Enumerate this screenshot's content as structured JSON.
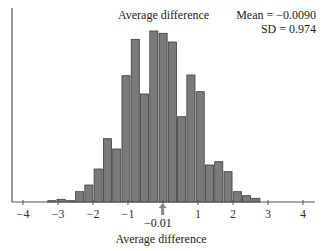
{
  "chart_data": {
    "type": "bar",
    "title": "Average difference",
    "xlabel": "Average difference",
    "ylabel": "",
    "annotations": {
      "mean_text": "Mean = −0.0090",
      "sd_text": "SD = 0.974",
      "mean_marker_label": "−0.01",
      "mean_marker_value": -0.01
    },
    "xlim": [
      -4.2,
      4.4
    ],
    "xticks": [
      -4,
      -3,
      -2,
      -1,
      0,
      1,
      2,
      3,
      4
    ],
    "xtick_labels": [
      "−4",
      "−3",
      "−2",
      "−1",
      "",
      "1",
      "2",
      "3",
      "4"
    ],
    "bin_start": -3.31,
    "bin_width": 0.265,
    "values": [
      1.3,
      2.7,
      1.3,
      10.3,
      17,
      33,
      63.3,
      53,
      126.3,
      162.7,
      108,
      171,
      168.7,
      160,
      85.3,
      127,
      110.3,
      37,
      40.3,
      30.3,
      10.3,
      6.3,
      3.7
    ],
    "ylim": [
      0,
      180
    ],
    "grid": false,
    "colors": {
      "bar_fill": "#7a7a7a",
      "bar_edge": "#3a3a3a",
      "axis": "#555555",
      "arrow": "#888888"
    }
  }
}
